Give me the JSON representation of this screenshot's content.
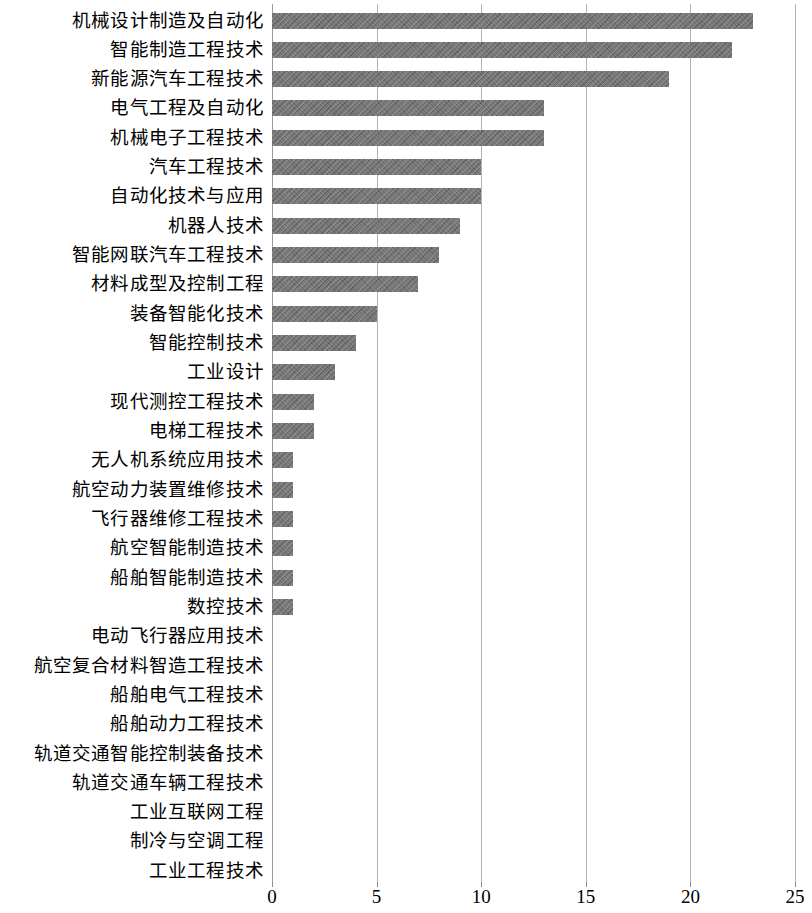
{
  "chart_data": {
    "type": "bar",
    "orientation": "horizontal",
    "title": "",
    "subtitle": "",
    "xlabel": "",
    "ylabel": "",
    "xlim": [
      0,
      25
    ],
    "xticks": [
      "0",
      "5",
      "10",
      "15",
      "20",
      "25"
    ],
    "xtick_values": [
      0,
      5,
      10,
      15,
      20,
      25
    ],
    "grid": "vertical",
    "legend": "none",
    "bar_color": "#6f6f6f",
    "grid_color": "#b4b4b4",
    "categories": [
      "机械设计制造及自动化",
      "智能制造工程技术",
      "新能源汽车工程技术",
      "电气工程及自动化",
      "机械电子工程技术",
      "汽车工程技术",
      "自动化技术与应用",
      "机器人技术",
      "智能网联汽车工程技术",
      "材料成型及控制工程",
      "装备智能化技术",
      "智能控制技术",
      "工业设计",
      "现代测控工程技术",
      "电梯工程技术",
      "无人机系统应用技术",
      "航空动力装置维修技术",
      "飞行器维修工程技术",
      "航空智能制造技术",
      "船舶智能制造技术",
      "数控技术",
      "电动飞行器应用技术",
      "航空复合材料智造工程技术",
      "船舶电气工程技术",
      "船舶动力工程技术",
      "轨道交通智能控制装备技术",
      "轨道交通车辆工程技术",
      "工业互联网工程",
      "制冷与空调工程",
      "工业工程技术"
    ],
    "values": [
      23,
      22,
      19,
      13,
      13,
      10,
      10,
      9,
      8,
      7,
      5,
      4,
      3,
      2,
      2,
      1,
      1,
      1,
      1,
      1,
      1,
      0,
      0,
      0,
      0,
      0,
      0,
      0,
      0,
      0
    ]
  }
}
